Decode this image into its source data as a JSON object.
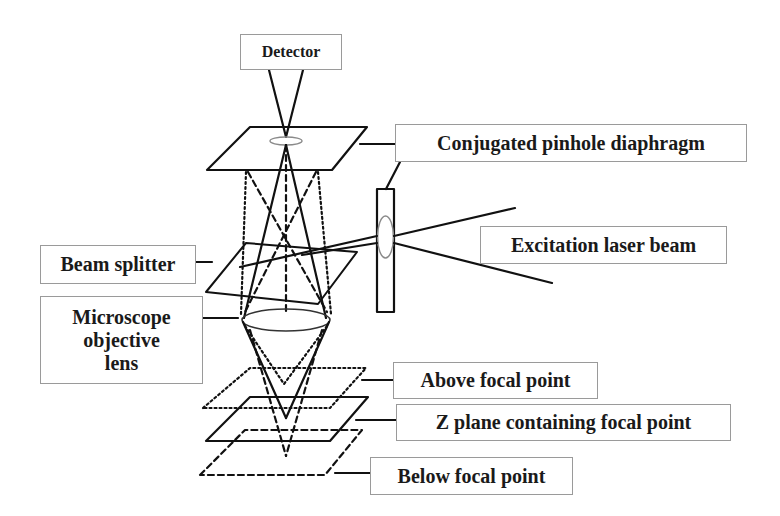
{
  "diagram": {
    "labels": {
      "detector": "Detector",
      "pinhole": "Conjugated pinhole diaphragm",
      "laser": "Excitation laser beam",
      "beam_splitter": "Beam splitter",
      "objective_line1": "Microscope",
      "objective_line2": "objective",
      "objective_line3": "lens",
      "above": "Above focal point",
      "focal_plane": "Z plane containing focal point",
      "below": "Below focal point"
    },
    "colors": {
      "stroke": "#111111",
      "box_border": "#9a9a9a",
      "lens_outline": "#8a8a8a",
      "background": "#ffffff"
    },
    "line_styles": {
      "focal_plane": "solid",
      "above_focal": "dotted",
      "below_focal": "dashed"
    }
  }
}
